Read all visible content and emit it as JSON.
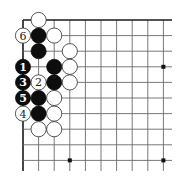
{
  "diagram": {
    "type": "go-board-corner",
    "corner": "top-left",
    "visible_columns": 10,
    "visible_rows": 10,
    "star_points": [
      {
        "col": 9,
        "row": 3
      },
      {
        "col": 3,
        "row": 9
      },
      {
        "col": 9,
        "row": 9
      }
    ],
    "stones": [
      {
        "color": "white",
        "col": 1,
        "row": 0,
        "label": ""
      },
      {
        "color": "white",
        "col": 0,
        "row": 1,
        "label": "6"
      },
      {
        "color": "black",
        "col": 1,
        "row": 1,
        "label": ""
      },
      {
        "color": "white",
        "col": 2,
        "row": 1,
        "label": ""
      },
      {
        "color": "black",
        "col": 1,
        "row": 2,
        "label": ""
      },
      {
        "color": "white",
        "col": 3,
        "row": 2,
        "label": ""
      },
      {
        "color": "black",
        "col": 0,
        "row": 3,
        "label": "1"
      },
      {
        "color": "black",
        "col": 2,
        "row": 3,
        "label": ""
      },
      {
        "color": "white",
        "col": 3,
        "row": 3,
        "label": ""
      },
      {
        "color": "black",
        "col": 0,
        "row": 4,
        "label": "3"
      },
      {
        "color": "white",
        "col": 1,
        "row": 4,
        "label": "2"
      },
      {
        "color": "black",
        "col": 2,
        "row": 4,
        "label": ""
      },
      {
        "color": "white",
        "col": 3,
        "row": 4,
        "label": ""
      },
      {
        "color": "black",
        "col": 0,
        "row": 5,
        "label": "5"
      },
      {
        "color": "black",
        "col": 1,
        "row": 5,
        "label": ""
      },
      {
        "color": "white",
        "col": 2,
        "row": 5,
        "label": ""
      },
      {
        "color": "white",
        "col": 0,
        "row": 6,
        "label": "4"
      },
      {
        "color": "black",
        "col": 1,
        "row": 6,
        "label": ""
      },
      {
        "color": "white",
        "col": 2,
        "row": 6,
        "label": ""
      },
      {
        "color": "white",
        "col": 1,
        "row": 7,
        "label": ""
      },
      {
        "color": "white",
        "col": 2,
        "row": 7,
        "label": ""
      }
    ],
    "colors": {
      "black_stone": "#0d0d0d",
      "white_stone": "#ffffff",
      "grid": "#6a6a6a",
      "edge": "#1a1a1a",
      "background": "#ffffff"
    }
  }
}
